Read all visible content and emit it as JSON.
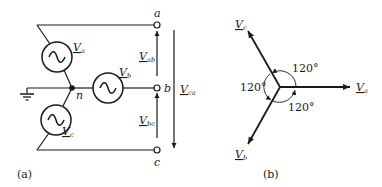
{
  "figure_a": {
    "caption": "(a)",
    "terminals": {
      "a": "a",
      "b": "b",
      "c": "c"
    },
    "neutral_label": "n",
    "sources": [
      {
        "name": "V",
        "sub": "a",
        "symbol": "~"
      },
      {
        "name": "V",
        "sub": "b",
        "symbol": "~"
      },
      {
        "name": "V",
        "sub": "c",
        "symbol": "~"
      }
    ],
    "line_voltages": [
      {
        "name": "V",
        "sub": "ab"
      },
      {
        "name": "V",
        "sub": "bc"
      },
      {
        "name": "V",
        "sub": "ca"
      }
    ],
    "ground_symbol": "ground-icon"
  },
  "figure_b": {
    "caption": "(b)",
    "phasors": [
      {
        "name": "V",
        "sub": "a",
        "angle_deg": 0
      },
      {
        "name": "V",
        "sub": "b",
        "angle_deg": -120
      },
      {
        "name": "V",
        "sub": "c",
        "angle_deg": 120
      }
    ],
    "angle_labels": [
      "120°",
      "120°",
      "120°"
    ]
  }
}
